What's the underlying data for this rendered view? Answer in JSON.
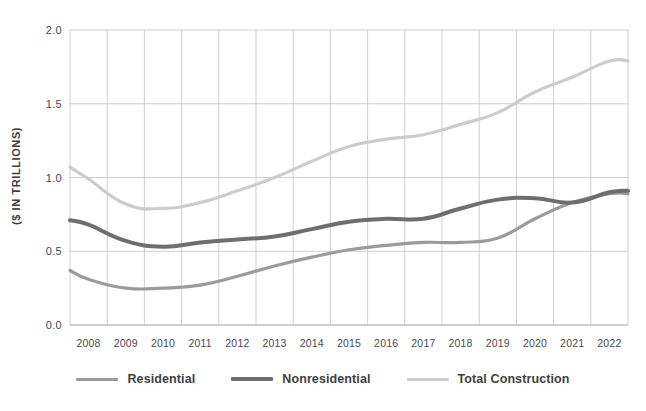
{
  "chart_data": {
    "type": "line",
    "title": "",
    "subtitle": "",
    "xlabel": "",
    "ylabel": "($ IN TRILLIONS)",
    "categories": [
      "2008",
      "2009",
      "2010",
      "2011",
      "2012",
      "2013",
      "2014",
      "2015",
      "2016",
      "2017",
      "2018",
      "2019",
      "2020",
      "2021",
      "2022"
    ],
    "xlim": [
      2007.5,
      2022.5
    ],
    "ylim": [
      0.0,
      2.0
    ],
    "yticks": [
      "0.0",
      "0.5",
      "1.0",
      "1.5",
      "2.0"
    ],
    "ytick_values": [
      0.0,
      0.5,
      1.0,
      1.5,
      2.0
    ],
    "grid": true,
    "legend_position": "bottom",
    "series": [
      {
        "name": "Residential",
        "color": "#9b9b9b",
        "width": 3.2,
        "values": [
          0.31,
          0.25,
          0.25,
          0.27,
          0.33,
          0.4,
          0.46,
          0.51,
          0.54,
          0.56,
          0.56,
          0.59,
          0.72,
          0.83,
          0.89
        ]
      },
      {
        "name": "Nonresidential",
        "color": "#6e6e6e",
        "width": 4.0,
        "values": [
          0.68,
          0.57,
          0.53,
          0.56,
          0.58,
          0.6,
          0.65,
          0.7,
          0.72,
          0.72,
          0.79,
          0.85,
          0.86,
          0.83,
          0.9
        ]
      },
      {
        "name": "Total Construction",
        "color": "#cccccc",
        "width": 3.2,
        "values": [
          0.99,
          0.82,
          0.79,
          0.83,
          0.91,
          1.0,
          1.11,
          1.21,
          1.26,
          1.29,
          1.36,
          1.44,
          1.58,
          1.68,
          1.79
        ]
      }
    ],
    "endpoints": {
      "left_edge": {
        "Residential": 0.37,
        "Nonresidential": 0.71,
        "Total Construction": 1.07
      },
      "right_edge": {
        "Residential": 0.89,
        "Nonresidential": 0.91,
        "Total Construction": 1.79
      }
    }
  },
  "legend": {
    "items": [
      {
        "label": "Residential",
        "swatch": "legend-line-residential"
      },
      {
        "label": "Nonresidential",
        "swatch": "legend-line-nonresidential"
      },
      {
        "label": "Total Construction",
        "swatch": "legend-line-total"
      }
    ]
  }
}
